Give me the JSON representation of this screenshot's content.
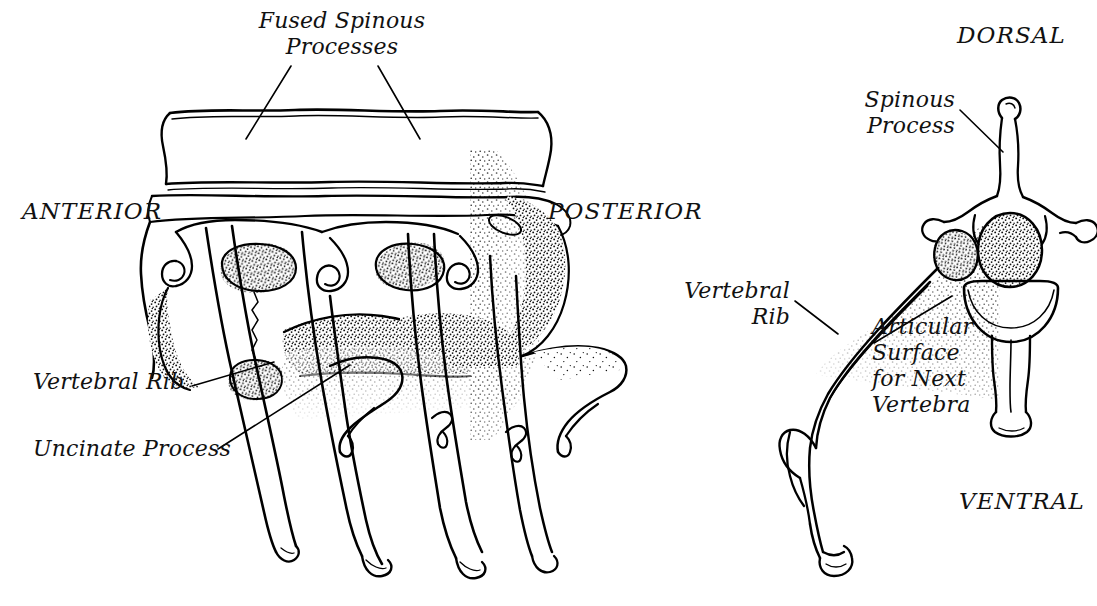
{
  "figure": {
    "domain": "anatomical-line-illustration",
    "background_color": "#ffffff",
    "ink_color": "#000000",
    "panels": [
      {
        "id": "left-panel",
        "name": "fused-vertebrae-lateral-view",
        "description": "Lateral view of fused vertebrae with vertebral ribs and uncinate processes"
      },
      {
        "id": "right-panel",
        "name": "single-vertebra-anterior-view",
        "description": "Anterior view of a single vertebra with attached vertebral rib"
      }
    ]
  },
  "labels": {
    "fused_spinous_processes": "Fused Spinous\nProcesses",
    "anterior": "ANTERIOR",
    "posterior": "POSTERIOR",
    "vertebral_rib_left": "Vertebral Rib",
    "uncinate_process": "Uncinate Process",
    "dorsal": "DORSAL",
    "ventral": "VENTRAL",
    "spinous_process": "Spinous\nProcess",
    "vertebral_rib_right": "Vertebral\nRib",
    "articular_surface": "Articular\nSurface\nfor Next\nVertebra"
  }
}
